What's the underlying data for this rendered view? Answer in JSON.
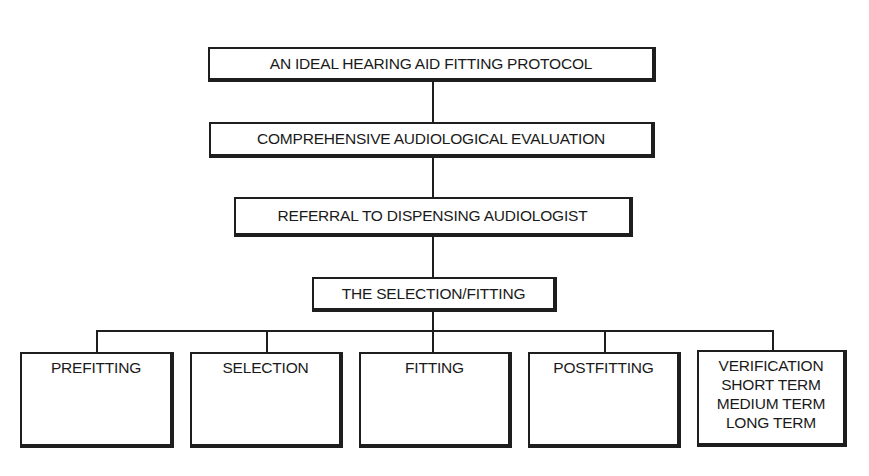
{
  "diagram": {
    "type": "flowchart-tree",
    "nodes": {
      "root": "AN IDEAL HEARING AID FITTING PROTOCOL",
      "evaluation": "COMPREHENSIVE AUDIOLOGICAL EVALUATION",
      "referral": "REFERRAL TO DISPENSING AUDIOLOGIST",
      "selection_fitting": "THE SELECTION/FITTING"
    },
    "leaves": [
      {
        "label": "PREFITTING"
      },
      {
        "label": "SELECTION"
      },
      {
        "label": "FITTING"
      },
      {
        "label": "POSTFITTING"
      },
      {
        "label": "VERIFICATION",
        "sub": [
          "SHORT TERM",
          "MEDIUM TERM",
          "LONG TERM"
        ]
      }
    ],
    "edges": [
      [
        "root",
        "evaluation"
      ],
      [
        "evaluation",
        "referral"
      ],
      [
        "referral",
        "selection_fitting"
      ],
      [
        "selection_fitting",
        "PREFITTING"
      ],
      [
        "selection_fitting",
        "SELECTION"
      ],
      [
        "selection_fitting",
        "FITTING"
      ],
      [
        "selection_fitting",
        "POSTFITTING"
      ],
      [
        "selection_fitting",
        "VERIFICATION"
      ]
    ],
    "colors": {
      "line": "#1e1e1e",
      "background": "#ffffff"
    }
  }
}
